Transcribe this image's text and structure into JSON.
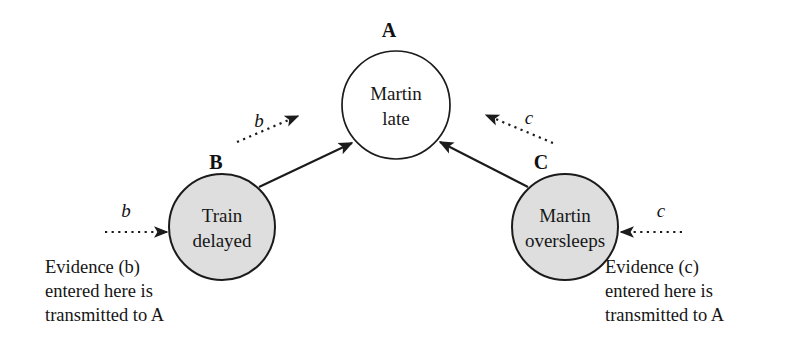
{
  "figure": {
    "type": "bayesian-network-diagram",
    "background_color": "#ffffff",
    "stroke_color": "#1b1b1b",
    "shaded_node_fill": "#dedede",
    "plain_node_fill": "#ffffff"
  },
  "nodes": {
    "a": {
      "tag": "A",
      "line1": "Martin",
      "line2": "late",
      "shaded": false,
      "cx": 396,
      "cy": 105,
      "r": 54
    },
    "b": {
      "tag": "B",
      "line1": "Train",
      "line2": "delayed",
      "shaded": true,
      "cx": 222,
      "cy": 227,
      "r": 53
    },
    "c": {
      "tag": "C",
      "line1": "Martin",
      "line2": "oversleeps",
      "shaded": true,
      "cx": 565,
      "cy": 227,
      "r": 53
    }
  },
  "edges": {
    "b_to_a_label": "b",
    "c_to_a_label": "c",
    "evidence_b_label": "b",
    "evidence_c_label": "c"
  },
  "captions": {
    "left": {
      "line1": "Evidence (b)",
      "line2": "entered here is",
      "line3": "transmitted to A"
    },
    "right": {
      "line1": "Evidence (c)",
      "line2": "entered here is",
      "line3": "transmitted to A"
    }
  }
}
